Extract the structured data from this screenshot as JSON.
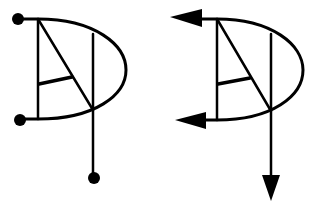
{
  "diagram": {
    "stroke_color": "#000000",
    "background": "#ffffff",
    "figures": [
      {
        "name": "symbol-with-dot-terminals",
        "terminals": [
          "dot",
          "dot",
          "dot"
        ]
      },
      {
        "name": "symbol-with-arrow-terminals",
        "terminals": [
          "arrow-left",
          "arrow-left",
          "arrow-down"
        ]
      }
    ]
  }
}
